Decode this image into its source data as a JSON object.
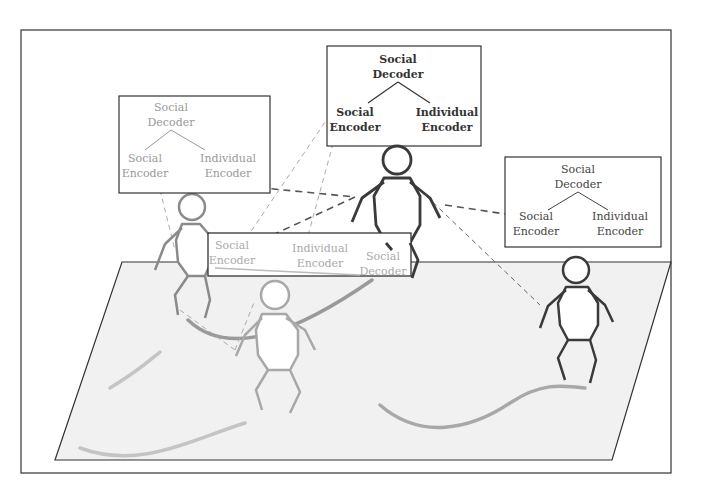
{
  "diagram": {
    "colors": {
      "background": "#ffffff",
      "frame": "#333333",
      "ground": "#f1f1f1",
      "dark": "#3a3a3a",
      "mid": "#7a7a7a",
      "light": "#a0a0a0",
      "trajectory": "#b9b9b9"
    },
    "boxes": {
      "top": {
        "decoder": [
          "Social",
          "Decoder"
        ],
        "left": [
          "Social",
          "Encoder"
        ],
        "right": [
          "Individual",
          "Encoder"
        ]
      },
      "left": {
        "decoder": [
          "Social",
          "Decoder"
        ],
        "left": [
          "Social",
          "Encoder"
        ],
        "right": [
          "Individual",
          "Encoder"
        ]
      },
      "right": {
        "decoder": [
          "Social",
          "Decoder"
        ],
        "left": [
          "Social",
          "Encoder"
        ],
        "right": [
          "Individual",
          "Encoder"
        ]
      },
      "middle": {
        "left": [
          "Social",
          "Encoder"
        ],
        "center": [
          "Individual",
          "Encoder"
        ],
        "right": [
          "Social",
          "Decoder"
        ]
      }
    },
    "agents": [
      {
        "id": "agent-center",
        "shade": "dark"
      },
      {
        "id": "agent-left",
        "shade": "mid"
      },
      {
        "id": "agent-front",
        "shade": "light"
      },
      {
        "id": "agent-right",
        "shade": "dark"
      }
    ]
  }
}
